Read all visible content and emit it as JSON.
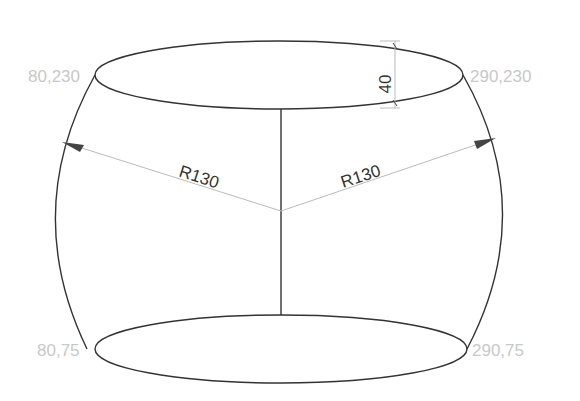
{
  "diagram": {
    "type": "barrel-shape-drawing",
    "colors": {
      "outline": "#333333",
      "dimension": "#bbbbbb",
      "label": "#c8c8c8",
      "arrow": "#444444"
    },
    "labels": {
      "top_left": "80,230",
      "top_right": "290,230",
      "bottom_left": "80,75",
      "bottom_right": "290,75",
      "radius_left": "R130",
      "radius_right": "R130",
      "height_dim": "40"
    }
  }
}
